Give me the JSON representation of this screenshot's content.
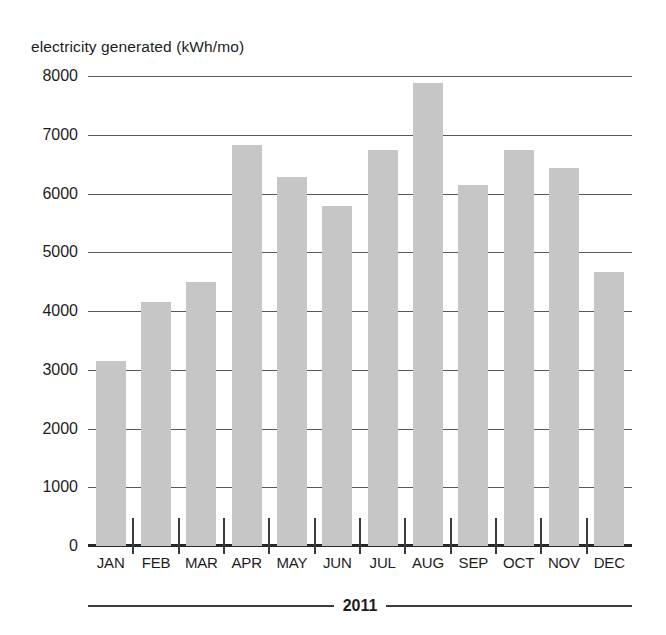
{
  "chart_data": {
    "type": "bar",
    "title": "electricity generated (kWh/mo)",
    "xlabel": "2011",
    "ylabel": "electricity generated (kWh/mo)",
    "categories": [
      "JAN",
      "FEB",
      "MAR",
      "APR",
      "MAY",
      "JUN",
      "JUL",
      "AUG",
      "SEP",
      "OCT",
      "NOV",
      "DEC"
    ],
    "values": [
      3150,
      4150,
      4500,
      6820,
      6280,
      5780,
      6740,
      7880,
      6140,
      6740,
      6440,
      4670
    ],
    "ylim": [
      0,
      8000
    ],
    "yticks": [
      8000,
      7000,
      6000,
      5000,
      4000,
      3000,
      2000,
      1000,
      0
    ],
    "ytick_labels": [
      "8000",
      "7000",
      "6000",
      "5000",
      "4000",
      "3000",
      "2000",
      "1000",
      "0"
    ],
    "grid": true,
    "legend": "none",
    "bar_color": "#c6c6c6",
    "axis_color": "#27292b",
    "grid_color": "#55595c",
    "series": [
      {
        "name": "electricity generated",
        "unit": "kWh/mo",
        "values": [
          3150,
          4150,
          4500,
          6820,
          6280,
          5780,
          6740,
          7880,
          6140,
          6740,
          6440,
          4670
        ]
      }
    ]
  },
  "year_band": {
    "label": "2011"
  }
}
